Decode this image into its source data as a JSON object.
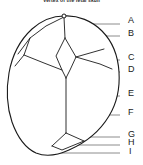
{
  "figure": {
    "title": "Vertex of the fetal skull",
    "colors": {
      "outline": "#1a1a1a",
      "suture": "#1a1a1a",
      "leader": "#8c8c8c",
      "label_text": "#1a1a1a",
      "background": "#ffffff"
    }
  },
  "labels": [
    {
      "id": "A",
      "text": "A",
      "x": 128,
      "y": 20,
      "leader": {
        "x1": 62,
        "y1": 24,
        "x2": 120,
        "y2": 24
      }
    },
    {
      "id": "B",
      "text": "B",
      "x": 128,
      "y": 33,
      "leader": {
        "x1": 75,
        "y1": 36,
        "x2": 120,
        "y2": 36
      }
    },
    {
      "id": "C",
      "text": "C",
      "x": 128,
      "y": 57,
      "leader": {
        "x1": 95,
        "y1": 60,
        "x2": 120,
        "y2": 60
      }
    },
    {
      "id": "D",
      "text": "D",
      "x": 128,
      "y": 69,
      "leader": {
        "x1": 58,
        "y1": 72,
        "x2": 120,
        "y2": 72
      }
    },
    {
      "id": "E",
      "text": "E",
      "x": 128,
      "y": 93,
      "leader": {
        "x1": 100,
        "y1": 96,
        "x2": 120,
        "y2": 96
      }
    },
    {
      "id": "F",
      "text": "F",
      "x": 128,
      "y": 112,
      "leader": {
        "x1": 62,
        "y1": 115,
        "x2": 120,
        "y2": 115
      }
    },
    {
      "id": "G",
      "text": "G",
      "x": 128,
      "y": 134,
      "leader": {
        "x1": 68,
        "y1": 137,
        "x2": 120,
        "y2": 137
      }
    },
    {
      "id": "H",
      "text": "H",
      "x": 128,
      "y": 142,
      "leader": {
        "x1": 56,
        "y1": 145,
        "x2": 120,
        "y2": 145
      }
    },
    {
      "id": "I",
      "text": "I",
      "x": 129,
      "y": 151,
      "leader": {
        "x1": 50,
        "y1": 153,
        "x2": 120,
        "y2": 153
      }
    }
  ],
  "geometry": {
    "outline": "M 64 16 C 78 15 92 21 102 31 C 112 41 118 56 119 72 C 120 88 117 103 109 116 C 100 131 85 143 69 150 C 58 155 46 157 36 153 C 25 148 17 136 12 122 C 7 107 6 90 9 73 C 12 56 20 40 32 29 C 41 21 52 16 64 16 Z",
    "sutures": [
      "M 64 17 L 65 38",
      "M 65 38 L 56 56 L 62 70 L 66 78",
      "M 65 38 L 76 57 L 70 70 L 66 78",
      "M 66 78 L 66 133",
      "M 76 57 L 90 53 L 104 49",
      "M 76 57 L 100 64 L 112 69",
      "M 64 17 L 46 26 L 30 38 L 18 54",
      "M 30 38 L 24 55 L 15 66",
      "M 24 55 L 44 63 L 62 70",
      "M 66 133 L 52 146",
      "M 66 133 L 84 141",
      "M 52 146 L 62 150 L 84 141"
    ],
    "apex_marker": {
      "cx": 64,
      "cy": 16,
      "r": 2
    }
  }
}
